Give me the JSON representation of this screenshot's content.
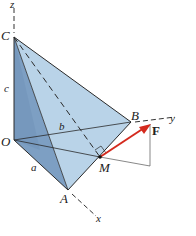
{
  "figure": {
    "axes": {
      "z": "z",
      "y": "y",
      "x": "x"
    },
    "points": {
      "C": "C",
      "O": "O",
      "B": "B",
      "A": "A",
      "M": "M"
    },
    "dimensions": {
      "a": "a",
      "b": "b",
      "c": "c"
    },
    "force": {
      "label": "F",
      "color": "#d42a1e"
    },
    "colors": {
      "face_light": "#b9d3e8",
      "face_mid": "#9dbcd9",
      "face_dark": "#7d9fc3",
      "edge": "#2a2a2a"
    }
  }
}
